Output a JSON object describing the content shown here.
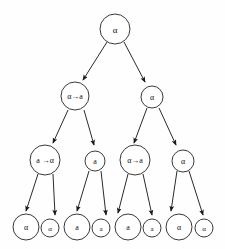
{
  "diagram": {
    "type": "binary-tree",
    "background_color": "#fefefe",
    "node_fill": "#ffffff",
    "node_stroke": "#3a3a3a",
    "edge_color": "#2a2a2a",
    "label_color": "#111111",
    "levels": [
      {
        "index": 0,
        "nodes": [
          {
            "id": "n0",
            "label": "α",
            "cx": 115,
            "cy": 29,
            "r": 15,
            "font_size": 9
          }
        ]
      },
      {
        "index": 1,
        "nodes": [
          {
            "id": "n1",
            "label": "α→a",
            "cx": 75,
            "cy": 96,
            "r": 14,
            "font_size": 8
          },
          {
            "id": "n2",
            "label": "α",
            "cx": 152,
            "cy": 97,
            "r": 11,
            "font_size": 8
          }
        ]
      },
      {
        "index": 2,
        "nodes": [
          {
            "id": "n3",
            "label": "a →α",
            "cx": 45,
            "cy": 160,
            "r": 15,
            "font_size": 8
          },
          {
            "id": "n4",
            "label": "a",
            "cx": 95,
            "cy": 161,
            "r": 10,
            "font_size": 8
          },
          {
            "id": "n5",
            "label": "α→a",
            "cx": 135,
            "cy": 160,
            "r": 15,
            "font_size": 8
          },
          {
            "id": "n6",
            "label": "α",
            "cx": 183,
            "cy": 161,
            "r": 11,
            "font_size": 8
          }
        ]
      },
      {
        "index": 3,
        "nodes": [
          {
            "id": "n7",
            "label": "α",
            "cx": 26,
            "cy": 227,
            "r": 13,
            "font_size": 8
          },
          {
            "id": "n8",
            "label": "α",
            "cx": 50,
            "cy": 228,
            "r": 9,
            "font_size": 7
          },
          {
            "id": "n9",
            "label": "a",
            "cx": 77,
            "cy": 227,
            "r": 13,
            "font_size": 8
          },
          {
            "id": "n10",
            "label": "a",
            "cx": 101,
            "cy": 228,
            "r": 9,
            "font_size": 7
          },
          {
            "id": "n11",
            "label": "a",
            "cx": 128,
            "cy": 227,
            "r": 13,
            "font_size": 8
          },
          {
            "id": "n12",
            "label": "a",
            "cx": 152,
            "cy": 228,
            "r": 9,
            "font_size": 7
          },
          {
            "id": "n13",
            "label": "α",
            "cx": 179,
            "cy": 227,
            "r": 13,
            "font_size": 8
          },
          {
            "id": "n14",
            "label": "α",
            "cx": 204,
            "cy": 228,
            "r": 9,
            "font_size": 7
          }
        ]
      }
    ],
    "edges": [
      {
        "id": "e0",
        "from": "n0",
        "to": "n1",
        "x1": 107,
        "y1": 42,
        "x2": 83,
        "y2": 80
      },
      {
        "id": "e1",
        "from": "n0",
        "to": "n2",
        "x1": 124,
        "y1": 42,
        "x2": 145,
        "y2": 82
      },
      {
        "id": "e2",
        "from": "n1",
        "to": "n3",
        "x1": 68,
        "y1": 110,
        "x2": 53,
        "y2": 143
      },
      {
        "id": "e3",
        "from": "n1",
        "to": "n4",
        "x1": 84,
        "y1": 110,
        "x2": 94,
        "y2": 145
      },
      {
        "id": "e4",
        "from": "n2",
        "to": "n5",
        "x1": 147,
        "y1": 108,
        "x2": 134,
        "y2": 143
      },
      {
        "id": "e5",
        "from": "n2",
        "to": "n6",
        "x1": 159,
        "y1": 108,
        "x2": 176,
        "y2": 145
      },
      {
        "id": "e6",
        "from": "n3",
        "to": "n7",
        "x1": 38,
        "y1": 174,
        "x2": 26,
        "y2": 211
      },
      {
        "id": "e7",
        "from": "n3",
        "to": "n8",
        "x1": 53,
        "y1": 174,
        "x2": 55,
        "y2": 215
      },
      {
        "id": "e8",
        "from": "n4",
        "to": "n9",
        "x1": 89,
        "y1": 171,
        "x2": 77,
        "y2": 211
      },
      {
        "id": "e9",
        "from": "n4",
        "to": "n10",
        "x1": 101,
        "y1": 171,
        "x2": 106,
        "y2": 215
      },
      {
        "id": "e10",
        "from": "n5",
        "to": "n11",
        "x1": 128,
        "y1": 174,
        "x2": 118,
        "y2": 213
      },
      {
        "id": "e11",
        "from": "n5",
        "to": "n12",
        "x1": 143,
        "y1": 174,
        "x2": 152,
        "y2": 215
      },
      {
        "id": "e12",
        "from": "n6",
        "to": "n13",
        "x1": 177,
        "y1": 171,
        "x2": 171,
        "y2": 211
      },
      {
        "id": "e13",
        "from": "n6",
        "to": "n14",
        "x1": 189,
        "y1": 171,
        "x2": 203,
        "y2": 215
      }
    ]
  }
}
